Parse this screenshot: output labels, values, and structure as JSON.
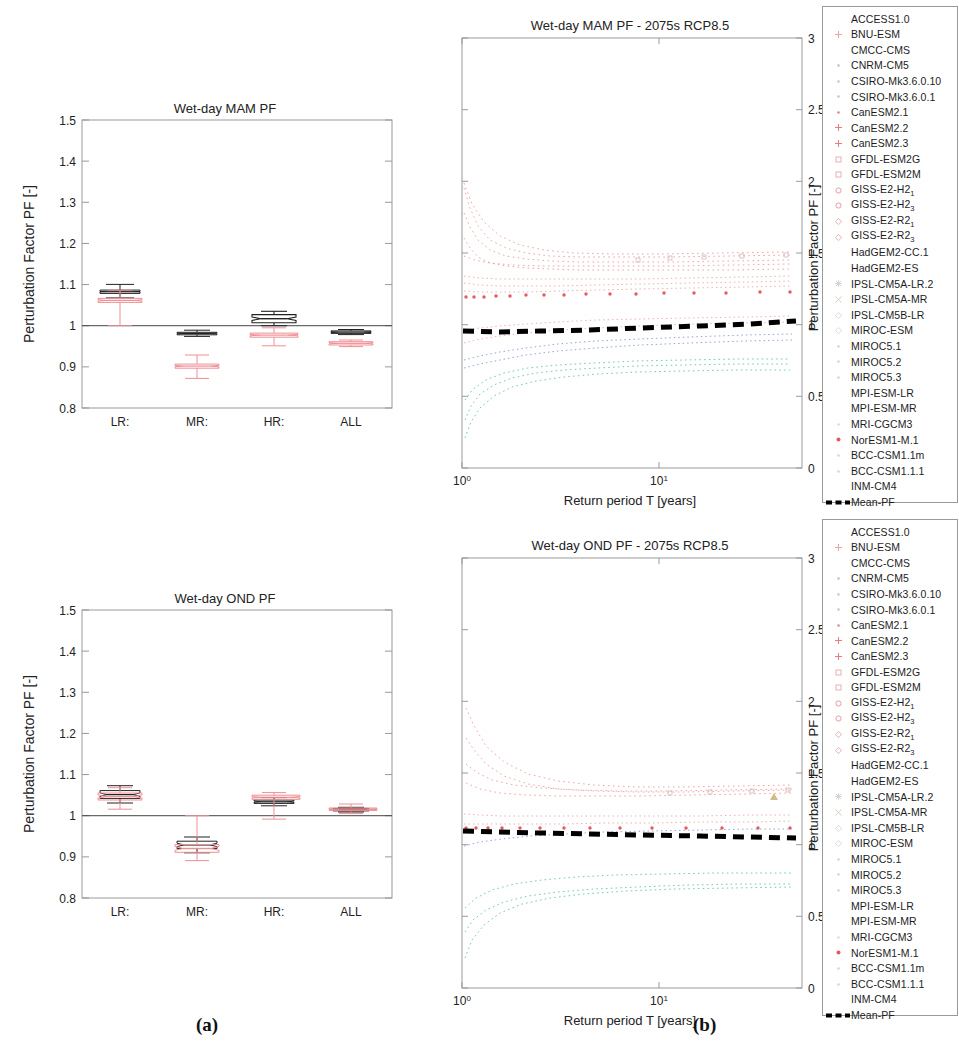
{
  "figure": {
    "caption_a": "(a)",
    "caption_b": "(b)"
  },
  "chart_data": [
    {
      "id": "box-mam",
      "type": "box",
      "title": "Wet-day MAM PF",
      "xlabel": "",
      "ylabel": "Perturbation Factor PF [-]",
      "ylim": [
        0.8,
        1.5
      ],
      "yticks": [
        0.8,
        0.9,
        1,
        1.1,
        1.2,
        1.3,
        1.4,
        1.5
      ],
      "ytick_labels": [
        "0.8",
        "0.9",
        "1",
        "1.1",
        "1.2",
        "1.3",
        "1.4",
        "1.5"
      ],
      "categories": [
        "LR:",
        "MR:",
        "HR:",
        "ALL"
      ],
      "reference_line": 1.0,
      "grid": false,
      "legend": "none",
      "series": [
        {
          "name": "black-boxes",
          "color": "#222222",
          "boxes": [
            {
              "category": "LR:",
              "q1": 1.038,
              "median": 1.043,
              "q3": 1.047,
              "low": 1.033,
              "high": 1.052,
              "notch_lo": 1.041,
              "notch_hi": 1.045
            },
            {
              "category": "MR:",
              "q1": 0.936,
              "median": 0.939,
              "q3": 0.942,
              "low": 0.931,
              "high": 0.946,
              "notch_lo": 0.9375,
              "notch_hi": 0.9405
            },
            {
              "category": "HR:",
              "q1": 0.955,
              "median": 0.965,
              "q3": 0.975,
              "low": 0.947,
              "high": 1.0,
              "notch_lo": 0.961,
              "notch_hi": 0.969
            },
            {
              "category": "ALL",
              "q1": 0.988,
              "median": 0.991,
              "q3": 0.994,
              "low": 0.985,
              "high": 0.997,
              "notch_lo": 0.99,
              "notch_hi": 0.992
            }
          ]
        },
        {
          "name": "red-boxes",
          "color": "#ef8f94",
          "boxes": [
            {
              "category": "LR:",
              "q1": 1.022,
              "median": 1.027,
              "q3": 1.032,
              "low": 1.0,
              "high": 1.038,
              "notch_lo": 1.025,
              "notch_hi": 1.029
            },
            {
              "category": "MR:",
              "q1": 0.856,
              "median": 0.861,
              "q3": 0.866,
              "low": 0.85,
              "high": 0.885,
              "notch_lo": 0.859,
              "notch_hi": 0.863
            },
            {
              "category": "HR:",
              "q1": 0.91,
              "median": 0.915,
              "q3": 0.92,
              "low": 0.903,
              "high": 0.932,
              "notch_lo": 0.913,
              "notch_hi": 0.917
            },
            {
              "category": "ALL",
              "q1": 0.94,
              "median": 0.944,
              "q3": 0.948,
              "low": 0.936,
              "high": 0.952,
              "notch_lo": 0.942,
              "notch_hi": 0.946
            }
          ]
        }
      ]
    },
    {
      "id": "box-ond",
      "type": "box",
      "title": "Wet-day OND PF",
      "xlabel": "",
      "ylabel": "Perturbation Factor PF [-]",
      "ylim": [
        0.8,
        1.5
      ],
      "yticks": [
        0.8,
        0.9,
        1,
        1.1,
        1.2,
        1.3,
        1.4,
        1.5
      ],
      "ytick_labels": [
        "0.8",
        "0.9",
        "1",
        "1.1",
        "1.2",
        "1.3",
        "1.4",
        "1.5"
      ],
      "categories": [
        "LR:",
        "MR:",
        "HR:",
        "ALL"
      ],
      "reference_line": 1.0,
      "grid": false,
      "legend": "none",
      "series": [
        {
          "name": "black-boxes",
          "color": "#222222",
          "boxes": [
            {
              "category": "LR:",
              "q1": 1.061,
              "median": 1.07,
              "q3": 1.08,
              "low": 1.048,
              "high": 1.09,
              "notch_lo": 1.066,
              "notch_hi": 1.074
            },
            {
              "category": "MR:",
              "q1": 0.938,
              "median": 0.947,
              "q3": 0.956,
              "low": 0.928,
              "high": 0.968,
              "notch_lo": 0.943,
              "notch_hi": 0.951
            },
            {
              "category": "HR:",
              "q1": 1.038,
              "median": 1.042,
              "q3": 1.046,
              "low": 1.032,
              "high": 1.052,
              "notch_lo": 1.04,
              "notch_hi": 1.044
            },
            {
              "category": "ALL",
              "q1": 1.018,
              "median": 1.021,
              "q3": 1.024,
              "low": 1.014,
              "high": 1.027,
              "notch_lo": 1.02,
              "notch_hi": 1.022
            }
          ]
        },
        {
          "name": "red-boxes",
          "color": "#ef8f94",
          "boxes": [
            {
              "category": "LR:",
              "q1": 1.055,
              "median": 1.063,
              "q3": 1.072,
              "low": 1.04,
              "high": 1.085,
              "notch_lo": 1.059,
              "notch_hi": 1.067
            },
            {
              "category": "MR:",
              "q1": 0.93,
              "median": 0.94,
              "q3": 0.949,
              "low": 0.92,
              "high": 1.0,
              "notch_lo": 0.936,
              "notch_hi": 0.944
            },
            {
              "category": "HR:",
              "q1": 1.04,
              "median": 1.045,
              "q3": 1.05,
              "low": 0.988,
              "high": 1.056,
              "notch_lo": 1.043,
              "notch_hi": 1.047
            },
            {
              "category": "ALL",
              "q1": 1.019,
              "median": 1.022,
              "q3": 1.025,
              "low": 1.015,
              "high": 1.029,
              "notch_lo": 1.021,
              "notch_hi": 1.023
            }
          ]
        }
      ]
    },
    {
      "id": "scatter-mam",
      "type": "scatter",
      "title": "Wet-day MAM PF - 2075s RCP8.5",
      "xlabel": "Return period T [years]",
      "ylabel": "Perturbation Factor PF [-]",
      "xscale": "log",
      "xlim": [
        1,
        50
      ],
      "xtick_labels": [
        "10^0",
        "10^1"
      ],
      "ylim": [
        0,
        3
      ],
      "yticks": [
        0,
        0.5,
        1,
        1.5,
        2,
        2.5,
        3
      ],
      "ytick_labels": [
        "0",
        "0.5",
        "1",
        "1.5",
        "2",
        "2.5",
        "3"
      ],
      "yaxis_position": "right",
      "grid": false,
      "legend": "right",
      "mean_pf": {
        "label": "Mean-PF",
        "color": "#000000",
        "style": "dashed",
        "x": [
          1,
          1.4,
          2,
          3,
          4,
          6,
          8,
          12,
          18,
          25,
          35,
          50
        ],
        "y": [
          0.955,
          0.952,
          0.953,
          0.955,
          0.958,
          0.962,
          0.966,
          0.972,
          0.978,
          0.983,
          0.988,
          0.995
        ]
      },
      "spread_envelope": {
        "x": [
          1,
          2,
          4,
          8,
          16,
          32,
          50
        ],
        "upper": [
          1.62,
          1.4,
          1.3,
          1.25,
          1.23,
          1.22,
          1.22
        ],
        "lower": [
          0.33,
          0.48,
          0.56,
          0.62,
          0.66,
          0.7,
          0.72
        ]
      }
    },
    {
      "id": "scatter-ond",
      "type": "scatter",
      "title": "Wet-day OND PF - 2075s RCP8.5",
      "xlabel": "Return period T [years]",
      "ylabel": "Perturbation Factor PF [-]",
      "xscale": "log",
      "xlim": [
        1,
        50
      ],
      "xtick_labels": [
        "10^0",
        "10^1"
      ],
      "ylim": [
        0,
        3
      ],
      "yticks": [
        0,
        0.5,
        1,
        1.5,
        2,
        2.5,
        3
      ],
      "ytick_labels": [
        "0",
        "0.5",
        "1",
        "1.5",
        "2",
        "2.5",
        "3"
      ],
      "yaxis_position": "right",
      "grid": false,
      "legend": "right",
      "mean_pf": {
        "label": "Mean-PF",
        "color": "#000000",
        "style": "dashed",
        "x": [
          1,
          1.4,
          2,
          3,
          4,
          6,
          8,
          12,
          18,
          25,
          35,
          50
        ],
        "y": [
          1.035,
          1.03,
          1.026,
          1.022,
          1.019,
          1.016,
          1.014,
          1.011,
          1.009,
          1.007,
          1.005,
          1.002
        ]
      },
      "spread_envelope": {
        "x": [
          1,
          2,
          4,
          8,
          16,
          32,
          50
        ],
        "upper": [
          1.55,
          1.45,
          1.32,
          1.25,
          1.22,
          1.2,
          1.2
        ],
        "lower": [
          0.33,
          0.55,
          0.68,
          0.76,
          0.82,
          0.86,
          0.88
        ]
      }
    }
  ],
  "legend": {
    "mean_label": "Mean-PF",
    "items": [
      {
        "label": "ACCESS1.0",
        "marker": "none",
        "color": "#cfcfcf"
      },
      {
        "label": "BNU-ESM",
        "marker": "plus",
        "color": "#e7a6a9"
      },
      {
        "label": "CMCC-CMS",
        "marker": "none",
        "color": "#cfcfcf"
      },
      {
        "label": "CNRM-CM5",
        "marker": "dot",
        "color": "#d9b7b8"
      },
      {
        "label": "CSIRO-Mk3.6.0.10",
        "marker": "dot",
        "color": "#e0bfbf"
      },
      {
        "label": "CSIRO-Mk3.6.0.1",
        "marker": "dot",
        "color": "#dcc0c0"
      },
      {
        "label": "CanESM2.1",
        "marker": "dot",
        "color": "#e18b90"
      },
      {
        "label": "CanESM2.2",
        "marker": "plus",
        "color": "#ec7a80"
      },
      {
        "label": "CanESM2.3",
        "marker": "plus",
        "color": "#ec7a80"
      },
      {
        "label": "GFDL-ESM2G",
        "marker": "square",
        "color": "#eab0b3"
      },
      {
        "label": "GFDL-ESM2M",
        "marker": "square",
        "color": "#eab0b3"
      },
      {
        "label": "GISS-E2-H2",
        "sub": "1",
        "marker": "circle",
        "color": "#e79ba0"
      },
      {
        "label": "GISS-E2-H2",
        "sub": "3",
        "marker": "circle",
        "color": "#e79ba0"
      },
      {
        "label": "GISS-E2-R2",
        "sub": "1",
        "marker": "diamond",
        "color": "#e6b2b4"
      },
      {
        "label": "GISS-E2-R2",
        "sub": "3",
        "marker": "diamond",
        "color": "#e6b2b4"
      },
      {
        "label": "HadGEM2-CC.1",
        "marker": "none",
        "color": "#d8d8d8"
      },
      {
        "label": "HadGEM2-ES",
        "marker": "none",
        "color": "#d8d8d8"
      },
      {
        "label": "IPSL-CM5A-LR.2",
        "marker": "star",
        "color": "#cfd8cf"
      },
      {
        "label": "IPSL-CM5A-MR",
        "marker": "times",
        "color": "#ddcdc2"
      },
      {
        "label": "IPSL-CM5B-LR",
        "marker": "diamond",
        "color": "#dcdcdc"
      },
      {
        "label": "MIROC-ESM",
        "marker": "diamond",
        "color": "#dcdcdc"
      },
      {
        "label": "MIROC5.1",
        "marker": "dot",
        "color": "#cbd8cf"
      },
      {
        "label": "MIROC5.2",
        "marker": "dot",
        "color": "#cbd8cf"
      },
      {
        "label": "MIROC5.3",
        "marker": "dot",
        "color": "#cbd8cf"
      },
      {
        "label": "MPI-ESM-LR",
        "marker": "none",
        "color": "#dadada"
      },
      {
        "label": "MPI-ESM-MR",
        "marker": "none",
        "color": "#dadada"
      },
      {
        "label": "MRI-CGCM3",
        "marker": "dot",
        "color": "#dcdcdc"
      },
      {
        "label": "NorESM1-M.1",
        "marker": "dot-solid",
        "color": "#e8585f"
      },
      {
        "label": "BCC-CSM1.1m",
        "marker": "dot",
        "color": "#d6d6d6"
      },
      {
        "label": "BCC-CSM1.1.1",
        "marker": "dot",
        "color": "#d6d6d6"
      },
      {
        "label": "INM-CM4",
        "marker": "none",
        "color": "#d6d6d6"
      }
    ]
  }
}
